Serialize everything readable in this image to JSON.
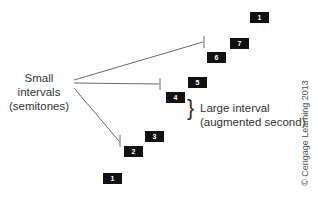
{
  "diagram": {
    "notes": [
      {
        "degree": "1",
        "x": 103,
        "y": 173
      },
      {
        "degree": "2",
        "x": 124,
        "y": 146
      },
      {
        "degree": "3",
        "x": 145,
        "y": 131
      },
      {
        "degree": "4",
        "x": 166,
        "y": 92
      },
      {
        "degree": "5",
        "x": 188,
        "y": 77
      },
      {
        "degree": "6",
        "x": 207,
        "y": 52
      },
      {
        "degree": "7",
        "x": 230,
        "y": 38
      },
      {
        "degree": "1",
        "x": 250,
        "y": 12
      }
    ],
    "small_label_line1": "Small intervals",
    "small_label_line2": "(semitones)",
    "large_label_line1": "Large interval",
    "large_label_line2": "(augmented second)",
    "brace": "}",
    "copyright": "© Cengage Learning 2013"
  }
}
